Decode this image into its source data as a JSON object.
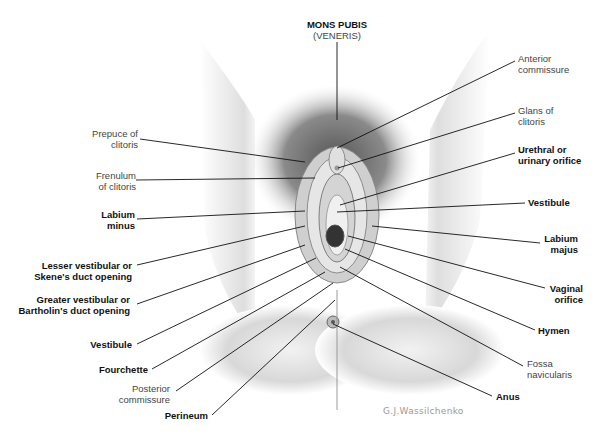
{
  "figure": {
    "type": "anatomical-illustration"
  },
  "labels": {
    "mons_pubis": {
      "line1": "MONS PUBIS",
      "line2": "(VENERIS)"
    },
    "prepuce": {
      "line1": "Prepuce of",
      "line2": "clitoris"
    },
    "frenulum": {
      "line1": "Frenulum",
      "line2": "of clitoris"
    },
    "labium_minus": {
      "line1": "Labium",
      "line2": "minus"
    },
    "lesser_vestibular": {
      "line1": "Lesser vestibular or",
      "line2": "Skene's duct opening"
    },
    "greater_vestibular": {
      "line1": "Greater vestibular or",
      "line2": "Bartholin's duct opening"
    },
    "vestibule_left": {
      "line1": "Vestibule"
    },
    "fourchette": {
      "line1": "Fourchette"
    },
    "posterior_commissure": {
      "line1": "Posterior",
      "line2": "commissure"
    },
    "perineum": {
      "line1": "Perineum"
    },
    "anterior_commissure": {
      "line1": "Anterior",
      "line2": "commissure"
    },
    "glans": {
      "line1": "Glans of",
      "line2": "clitoris"
    },
    "urethral": {
      "line1": "Urethral or",
      "line2": "urinary orifice"
    },
    "vestibule_right": {
      "line1": "Vestibule"
    },
    "labium_majus": {
      "line1": "Labium",
      "line2": "majus"
    },
    "vaginal_orifice": {
      "line1": "Vaginal",
      "line2": "orifice"
    },
    "hymen": {
      "line1": "Hymen"
    },
    "fossa": {
      "line1": "Fossa",
      "line2": "navicularis"
    },
    "anus": {
      "line1": "Anus"
    }
  },
  "signature": "G.J.Wassilchenko"
}
